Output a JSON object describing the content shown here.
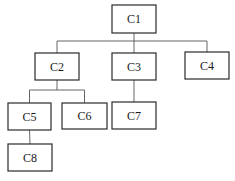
{
  "diagram": {
    "type": "tree",
    "nodes": [
      {
        "id": "C1",
        "label": "C1"
      },
      {
        "id": "C2",
        "label": "C2"
      },
      {
        "id": "C3",
        "label": "C3"
      },
      {
        "id": "C4",
        "label": "C4"
      },
      {
        "id": "C5",
        "label": "C5"
      },
      {
        "id": "C6",
        "label": "C6"
      },
      {
        "id": "C7",
        "label": "C7"
      },
      {
        "id": "C8",
        "label": "C8"
      }
    ],
    "edges": [
      {
        "from": "C1",
        "to": "C2"
      },
      {
        "from": "C1",
        "to": "C3"
      },
      {
        "from": "C1",
        "to": "C4"
      },
      {
        "from": "C2",
        "to": "C5"
      },
      {
        "from": "C2",
        "to": "C6"
      },
      {
        "from": "C3",
        "to": "C7"
      },
      {
        "from": "C5",
        "to": "C8"
      }
    ],
    "colors": {
      "box_stroke": "#2a2a2a",
      "edge": "#555555",
      "background": "#ffffff"
    }
  }
}
